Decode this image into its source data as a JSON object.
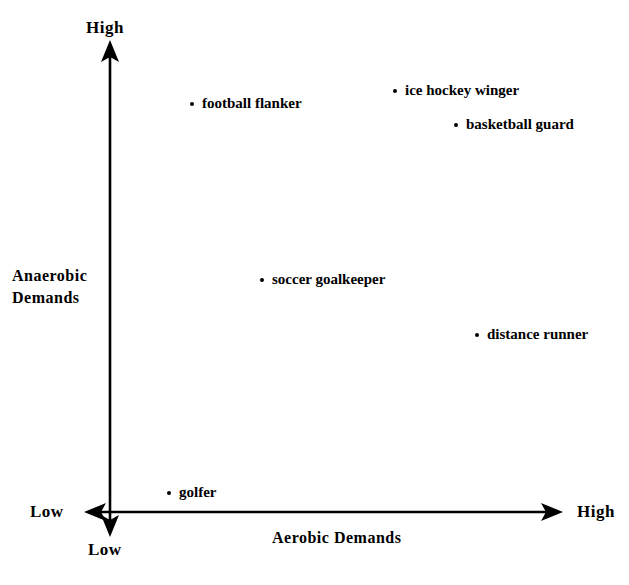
{
  "figure": {
    "background_color": "#ffffff",
    "ink_color": "#000000",
    "width": 629,
    "height": 585
  },
  "axes": {
    "y_title": "Anaerobic\nDemands",
    "y_title_line1": "Anaerobic",
    "y_title_line2": "Demands",
    "x_title": "Aerobic  Demands",
    "y_high_label": "High",
    "y_low_label": "Low",
    "x_low_label": "Low",
    "x_high_label": "High"
  },
  "chart_data": {
    "type": "scatter",
    "title": "",
    "xlabel": "Aerobic Demands",
    "ylabel": "Anaerobic Demands",
    "xlim": [
      0,
      100
    ],
    "ylim": [
      0,
      100
    ],
    "xtick_labels": [
      "Low",
      "High"
    ],
    "ytick_labels": [
      "Low",
      "High"
    ],
    "grid": false,
    "legend": false,
    "points": [
      {
        "label": "football flanker",
        "x": 18,
        "y": 88,
        "px": 192,
        "py": 103
      },
      {
        "label": "ice hockey winger",
        "x": 63,
        "y": 91,
        "px": 395,
        "py": 90
      },
      {
        "label": "basketball guard",
        "x": 77,
        "y": 83,
        "px": 456,
        "py": 124
      },
      {
        "label": "soccer goalkeeper",
        "x": 34,
        "y": 50,
        "px": 262,
        "py": 279
      },
      {
        "label": "distance runner",
        "x": 81,
        "y": 38,
        "px": 477,
        "py": 334
      },
      {
        "label": "golfer",
        "x": 13,
        "y": 4,
        "px": 169,
        "py": 492
      }
    ]
  }
}
